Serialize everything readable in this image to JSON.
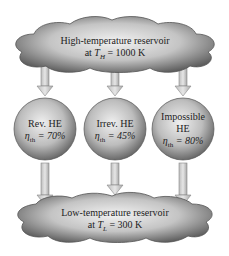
{
  "top_reservoir": {
    "line1": "High-temperature reservoir",
    "line2_prefix": "at ",
    "var": "T",
    "sub": "H",
    "line2_suffix": " = 1000 K"
  },
  "bottom_reservoir": {
    "line1": "Low-temperature reservoir",
    "line2_prefix": "at ",
    "var": "T",
    "sub": "L",
    "line2_suffix": " = 300 K"
  },
  "engines": [
    {
      "name_line1": "Rev. HE",
      "name_line2": "",
      "eta_var": "η",
      "eta_sub": "th",
      "eta_value": " = 70%"
    },
    {
      "name_line1": "Irrev. HE",
      "name_line2": "",
      "eta_var": "η",
      "eta_sub": "th",
      "eta_value": " = 45%"
    },
    {
      "name_line1": "Impossible",
      "name_line2": "HE",
      "eta_var": "η",
      "eta_sub": "th",
      "eta_value": " = 80%"
    }
  ],
  "colors": {
    "cloud_light": "#e8e8e8",
    "cloud_dark": "#6e6e6e",
    "arrow": "#c8c8c8",
    "arrow_stroke": "#888888"
  }
}
